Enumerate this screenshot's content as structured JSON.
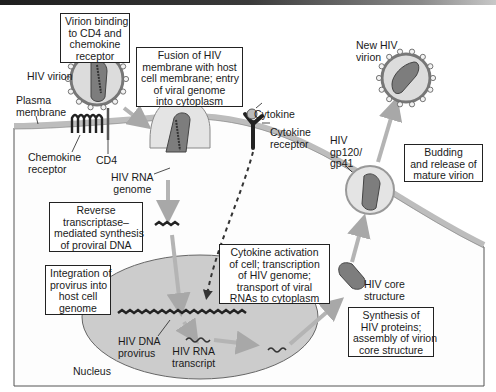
{
  "colors": {
    "membrane": "#bdbdbd",
    "cytoplasm": "#fdfdfd",
    "nucleus": "#c8c8c8",
    "virion_fill": "#dcdcdc",
    "core_fill": "#7a7a7a",
    "arrow": "#b4b4b4",
    "text": "#1a1a1a"
  },
  "boxes": {
    "binding": "Virion binding\nto CD4 and\nchemokine\nreceptor",
    "fusion": "Fusion of HIV\nmembrane with host\ncell membrane; entry\nof viral genome\ninto cytoplasm",
    "reverse_transcription": "Reverse\ntranscriptase–\nmediated synthesis\nof proviral DNA",
    "integration": "Integration of\nprovirus into\nhost cell\ngenome",
    "cytokine_activation": "Cytokine activation\nof cell; transcription\nof HIV genome;\ntransport of viral\nRNAs to cytoplasm",
    "synthesis": "Synthesis of\nHIV proteins;\nassembly of virion\ncore structure",
    "budding": "Budding\nand release of\nmature virion"
  },
  "labels": {
    "hiv_virion": "HIV virion",
    "plasma_membrane": "Plasma\nmembrane",
    "chemokine_receptor": "Chemokine\nreceptor",
    "cd4": "CD4",
    "hiv_rna_genome": "HIV RNA\ngenome",
    "cytokine": "Cytokine",
    "cytokine_receptor": "Cytokine\nreceptor",
    "new_hiv_virion": "New HIV\nvirion",
    "gp120_gp41": "HIV\ngp120/\ngp41",
    "hiv_core_structure": "HIV core\nstructure",
    "hiv_dna_provirus": "HIV DNA\nprovirus",
    "hiv_rna_transcript": "HIV RNA\ntranscript",
    "nucleus": "Nucleus"
  }
}
